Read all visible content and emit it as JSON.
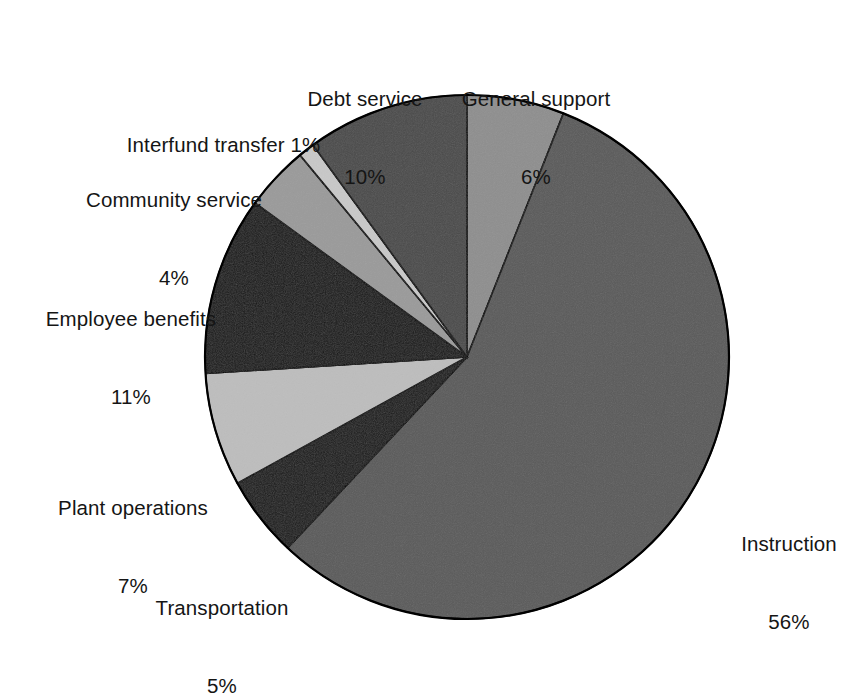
{
  "chart_data": {
    "type": "pie",
    "title": "",
    "subtitle": "",
    "xlabel": "",
    "ylabel": "",
    "legend_position": "none",
    "grid": false,
    "units": "percent",
    "start_angle_deg": 0,
    "direction": "clockwise",
    "categories": [
      "General support",
      "Instruction",
      "Transportation",
      "Plant operations",
      "Employee benefits",
      "Community service",
      "Interfund transfer",
      "Debt service"
    ],
    "values": [
      6,
      56,
      5,
      7,
      11,
      4,
      1,
      10
    ],
    "colors": [
      "#8e8e8e",
      "#5a5a5a",
      "#1a1a1a",
      "#bdbdbd",
      "#181818",
      "#9a9a9a",
      "#c8c8c8",
      "#4a4a4a"
    ],
    "slices": [
      {
        "label": "General support",
        "value": 6,
        "value_text": "6%",
        "color": "#8e8e8e",
        "label_name": "General support",
        "label_pct": "6%"
      },
      {
        "label": "Instruction",
        "value": 56,
        "value_text": "56%",
        "color": "#5a5a5a",
        "label_name": "Instruction",
        "label_pct": "56%"
      },
      {
        "label": "Transportation",
        "value": 5,
        "value_text": "5%",
        "color": "#1a1a1a",
        "label_name": "Transportation",
        "label_pct": "5%"
      },
      {
        "label": "Plant operations",
        "value": 7,
        "value_text": "7%",
        "color": "#bdbdbd",
        "label_name": "Plant operations",
        "label_pct": "7%"
      },
      {
        "label": "Employee benefits",
        "value": 11,
        "value_text": "11%",
        "color": "#181818",
        "label_name": "Employee benefits",
        "label_pct": "11%"
      },
      {
        "label": "Community service",
        "value": 4,
        "value_text": "4%",
        "color": "#9a9a9a",
        "label_name": "Community service",
        "label_pct": "4%"
      },
      {
        "label": "Interfund transfer",
        "value": 1,
        "value_text": "1%",
        "color": "#c8c8c8",
        "label_name": "Interfund transfer",
        "label_pct": "1%"
      },
      {
        "label": "Debt service",
        "value": 10,
        "value_text": "10%",
        "color": "#4a4a4a",
        "label_name": "Debt service",
        "label_pct": "10%"
      }
    ]
  },
  "geometry": {
    "center_x": 467,
    "center_y": 357,
    "radius": 262,
    "outline_color": "#000000"
  },
  "labels": {
    "debt_service": {
      "name": "Debt service",
      "pct": "10%"
    },
    "general_support": {
      "name": "General support",
      "pct": "6%"
    },
    "interfund_transfer": {
      "name": "Interfund transfer",
      "pct": "1%"
    },
    "community_service": {
      "name": "Community service",
      "pct": "4%"
    },
    "employee_benefits": {
      "name": "Employee benefits",
      "pct": "11%"
    },
    "plant_operations": {
      "name": "Plant operations",
      "pct": "7%"
    },
    "transportation": {
      "name": "Transportation",
      "pct": "5%"
    },
    "instruction": {
      "name": "Instruction",
      "pct": "56%"
    }
  }
}
